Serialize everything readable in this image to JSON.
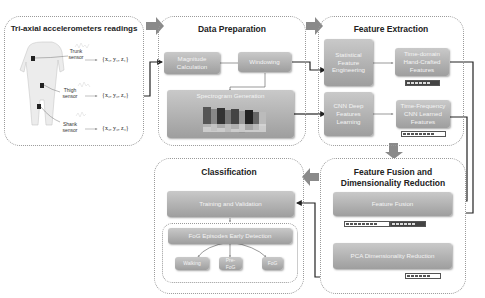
{
  "panels": {
    "sensors": {
      "title": "Tri-axial accelerometers readings",
      "sensors": [
        {
          "label": "Trunk\nsensor",
          "vector": "{x₁, y₁, z₁}"
        },
        {
          "label": "Thigh\nsensor",
          "vector": "{x₂, y₂, z₂}"
        },
        {
          "label": "Shank\nsensor",
          "vector": "{x₃, y₃, z₃}"
        }
      ]
    },
    "data_preparation": {
      "title": "Data Preparation",
      "magnitude": "Magnitude Calculation",
      "windowing": "Windowing",
      "spectrogram": "Spectrogram Generation"
    },
    "feature_extraction": {
      "title": "Feature Extraction",
      "statistical": "Statistical Feature Engineering",
      "time_domain": "Time-domain Hand-Crafted Features",
      "cnn": "CNN Deep Features Learning",
      "time_freq": "Time-Frequency CNN Learned Features"
    },
    "fusion": {
      "title_line1": "Feature Fusion and",
      "title_line2": "Dimensionality Reduction",
      "fusion": "Feature Fusion",
      "pca": "PCA Dimensionality Reduction"
    },
    "classification": {
      "title": "Classification",
      "training": "Training and Validation",
      "detection": "FoG Episodes Early Detection",
      "classes": [
        "Walking",
        "Pre-FoG",
        "FoG"
      ]
    }
  },
  "colors": {
    "box_top": "#c9c9c9",
    "box_bottom": "#9e9e9e",
    "arrow": "#8a8a8a",
    "border": "#9a9a9a"
  }
}
